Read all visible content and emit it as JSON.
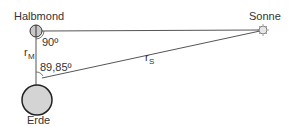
{
  "labels": {
    "moon": "Halbmond",
    "sun": "Sonne",
    "earth": "Erde",
    "angle_moon": "90º",
    "angle_earth": "89,85º",
    "r_moon_main": "r",
    "r_moon_sub": "M",
    "r_sun_main": "r",
    "r_sun_sub": "S"
  },
  "colors": {
    "line": "#555555",
    "earth_fill": "#d4d4d4",
    "earth_stroke": "#222222",
    "moon_fill": "#c8c8c8",
    "sun_fill": "#e6e6e6"
  }
}
